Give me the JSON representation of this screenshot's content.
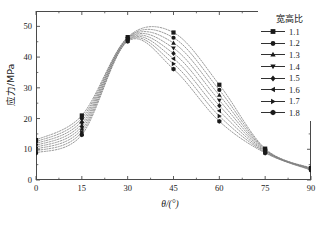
{
  "chart_data": {
    "type": "line",
    "title": "",
    "xlabel": "θ/(°)",
    "ylabel": "应力/MPa",
    "xlim": [
      0,
      90
    ],
    "ylim": [
      0,
      55
    ],
    "xticks": [
      0,
      15,
      30,
      45,
      60,
      75,
      90
    ],
    "yticks": [
      0,
      10,
      20,
      30,
      40,
      50
    ],
    "xtick_labels": [
      "0",
      "15",
      "30",
      "45",
      "60",
      "75",
      "90"
    ],
    "ytick_labels": [
      "0",
      "10",
      "20",
      "30",
      "40",
      "50"
    ],
    "grid": false,
    "legend_position": "top-right",
    "legend_title": "宽高比",
    "marker_x": [
      0,
      15,
      30,
      45,
      60,
      75,
      90
    ],
    "series": [
      {
        "name": "1.1",
        "marker": "square",
        "values": [
          13.0,
          21.0,
          46.5,
          48.0,
          31.0,
          10.2,
          3.9
        ]
      },
      {
        "name": "1.2",
        "marker": "circle",
        "values": [
          12.4,
          20.1,
          46.3,
          46.3,
          29.3,
          10.0,
          3.8
        ]
      },
      {
        "name": "1.3",
        "marker": "triangle-up",
        "values": [
          11.8,
          19.2,
          46.1,
          44.6,
          27.6,
          9.8,
          3.7
        ]
      },
      {
        "name": "1.4",
        "marker": "triangle-down",
        "values": [
          11.2,
          18.3,
          45.9,
          42.9,
          25.9,
          9.6,
          3.6
        ]
      },
      {
        "name": "1.5",
        "marker": "diamond",
        "values": [
          10.6,
          17.4,
          45.7,
          41.2,
          24.2,
          9.4,
          3.5
        ]
      },
      {
        "name": "1.6",
        "marker": "triangle-left",
        "values": [
          10.0,
          16.5,
          45.5,
          39.5,
          22.5,
          9.2,
          3.4
        ]
      },
      {
        "name": "1.7",
        "marker": "triangle-right",
        "values": [
          9.4,
          15.6,
          45.3,
          37.8,
          20.8,
          9.0,
          3.3
        ]
      },
      {
        "name": "1.8",
        "marker": "hexagon",
        "values": [
          8.8,
          14.7,
          45.1,
          36.1,
          19.1,
          8.8,
          3.2
        ]
      }
    ],
    "line_color": "#808080",
    "marker_color": "#1a1a1a",
    "axis_color": "#4a4a4a"
  }
}
